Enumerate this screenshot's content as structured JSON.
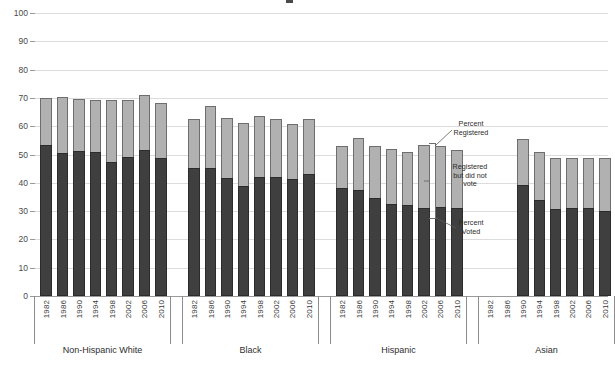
{
  "chart_data": {
    "type": "bar",
    "subtype": "stacked-grouped",
    "title": "",
    "xlabel": "",
    "ylabel": "",
    "ylim": [
      0,
      100
    ],
    "ytick_step": 10,
    "yticks": [
      0,
      10,
      20,
      30,
      40,
      50,
      60,
      70,
      80,
      90,
      100
    ],
    "grid": true,
    "legend_position": "inline-annotation",
    "series": [
      {
        "name": "Percent Voted",
        "color": "#3f3f3f"
      },
      {
        "name": "Registered but did not vote",
        "color": "#b1b1b1"
      }
    ],
    "groups": [
      {
        "name": "Non-Hispanic White",
        "categories": [
          "1982",
          "1986",
          "1990",
          "1994",
          "1998",
          "2002",
          "2006",
          "2010"
        ],
        "registered": [
          69.9,
          70.2,
          69.7,
          69.4,
          69.3,
          69.3,
          71.0,
          68.2
        ],
        "voted": [
          53.4,
          50.7,
          51.2,
          50.8,
          47.3,
          49.1,
          51.5,
          48.6
        ]
      },
      {
        "name": "Black",
        "categories": [
          "1982",
          "1986",
          "1990",
          "1994",
          "1998",
          "2002",
          "2006",
          "2010"
        ],
        "registered": [
          62.6,
          67.0,
          63.0,
          61.1,
          63.5,
          62.4,
          60.9,
          62.4
        ],
        "voted": [
          45.1,
          45.4,
          41.8,
          38.9,
          41.9,
          42.2,
          41.2,
          43.1
        ]
      },
      {
        "name": "Hispanic",
        "categories": [
          "1982",
          "1986",
          "1990",
          "1994",
          "1998",
          "2002",
          "2006",
          "2010"
        ],
        "registered": [
          53.0,
          55.8,
          53.1,
          52.1,
          51.0,
          53.4,
          53.0,
          51.6
        ],
        "voted": [
          38.0,
          37.5,
          34.5,
          32.6,
          32.0,
          31.0,
          31.4,
          31.2
        ]
      },
      {
        "name": "Asian",
        "categories": [
          "1982",
          "1986",
          "1990",
          "1994",
          "1998",
          "2002",
          "2006",
          "2010"
        ],
        "registered": [
          null,
          null,
          55.5,
          51.0,
          48.6,
          48.6,
          48.6,
          48.7
        ],
        "voted": [
          null,
          null,
          39.4,
          33.9,
          30.9,
          31.2,
          31.2,
          30.0
        ]
      }
    ],
    "annotations": [
      {
        "id": "percent-registered",
        "text": "Percent\nRegistered"
      },
      {
        "id": "registered-not-voted",
        "text": "Registered\nbut did not\nvote"
      },
      {
        "id": "percent-voted",
        "text": "Percent\nVoted"
      }
    ]
  }
}
